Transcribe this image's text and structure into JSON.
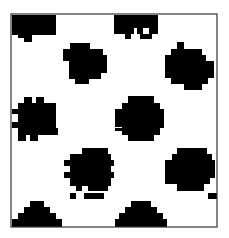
{
  "image": {
    "width": 229,
    "height": 238,
    "background": "#ffffff",
    "foreground": "#000000",
    "frame": {
      "x": 11,
      "y": 14,
      "w": 206,
      "h": 213,
      "stroke": "#333333"
    }
  },
  "blobs": [
    {
      "name": "blob-top-left",
      "rects": [
        [
          12,
          15,
          44,
          20
        ],
        [
          18,
          35,
          14,
          3
        ],
        [
          24,
          38,
          8,
          4
        ]
      ]
    },
    {
      "name": "blob-top-center",
      "rects": [
        [
          114,
          15,
          44,
          13
        ],
        [
          114,
          28,
          20,
          6
        ],
        [
          137,
          28,
          6,
          6
        ],
        [
          149,
          28,
          9,
          6
        ],
        [
          125,
          34,
          6,
          5
        ],
        [
          140,
          34,
          12,
          5
        ]
      ]
    },
    {
      "name": "blob-upper-mid",
      "rects": [
        [
          70,
          43,
          20,
          6
        ],
        [
          63,
          49,
          40,
          6
        ],
        [
          63,
          55,
          44,
          6
        ],
        [
          69,
          61,
          38,
          12
        ],
        [
          69,
          73,
          32,
          6
        ],
        [
          75,
          79,
          14,
          5
        ]
      ]
    },
    {
      "name": "blob-upper-right",
      "rects": [
        [
          177,
          42,
          7,
          7
        ],
        [
          171,
          49,
          31,
          6
        ],
        [
          165,
          55,
          41,
          6
        ],
        [
          165,
          61,
          49,
          17
        ],
        [
          171,
          78,
          37,
          6
        ],
        [
          184,
          84,
          18,
          6
        ]
      ]
    },
    {
      "name": "blob-center",
      "rects": [
        [
          128,
          96,
          26,
          7
        ],
        [
          122,
          103,
          38,
          6
        ],
        [
          115,
          109,
          49,
          14
        ],
        [
          115,
          123,
          8,
          4
        ],
        [
          122,
          123,
          42,
          5
        ],
        [
          115,
          128,
          8,
          3
        ],
        [
          122,
          128,
          38,
          7
        ],
        [
          128,
          135,
          26,
          6
        ]
      ]
    },
    {
      "name": "blob-mid-left",
      "rects": [
        [
          24,
          97,
          8,
          6
        ],
        [
          36,
          97,
          8,
          6
        ],
        [
          18,
          103,
          38,
          6
        ],
        [
          12,
          109,
          44,
          5
        ],
        [
          18,
          114,
          38,
          8
        ],
        [
          12,
          122,
          44,
          6
        ],
        [
          18,
          128,
          40,
          7
        ],
        [
          18,
          135,
          8,
          6
        ],
        [
          30,
          135,
          8,
          6
        ]
      ]
    },
    {
      "name": "blob-lower-mid",
      "rects": [
        [
          82,
          148,
          26,
          6
        ],
        [
          70,
          154,
          41,
          6
        ],
        [
          64,
          160,
          50,
          6
        ],
        [
          70,
          166,
          41,
          6
        ],
        [
          64,
          172,
          50,
          6
        ],
        [
          70,
          178,
          41,
          8
        ],
        [
          76,
          186,
          6,
          5
        ],
        [
          88,
          186,
          20,
          5
        ]
      ]
    },
    {
      "name": "blob-lower-right",
      "rects": [
        [
          177,
          148,
          30,
          6
        ],
        [
          172,
          154,
          40,
          6
        ],
        [
          165,
          160,
          50,
          12
        ],
        [
          165,
          172,
          12,
          6
        ],
        [
          172,
          172,
          43,
          6
        ],
        [
          165,
          178,
          8,
          6
        ],
        [
          172,
          178,
          38,
          6
        ],
        [
          177,
          184,
          27,
          7
        ]
      ]
    },
    {
      "name": "blob-bottom-left",
      "rects": [
        [
          30,
          201,
          14,
          6
        ],
        [
          24,
          207,
          26,
          6
        ],
        [
          18,
          213,
          38,
          6
        ],
        [
          12,
          219,
          50,
          8
        ]
      ]
    },
    {
      "name": "blob-bottom-center",
      "rects": [
        [
          131,
          201,
          20,
          6
        ],
        [
          125,
          207,
          32,
          6
        ],
        [
          119,
          213,
          44,
          6
        ],
        [
          115,
          219,
          52,
          8
        ]
      ]
    },
    {
      "name": "blob-top-center-lower",
      "rects": [
        [
          70,
          193,
          6,
          6
        ],
        [
          84,
          193,
          20,
          6
        ]
      ]
    },
    {
      "name": "blob-bottom-right-edge",
      "rects": [
        [
          208,
          193,
          9,
          6
        ]
      ]
    }
  ]
}
